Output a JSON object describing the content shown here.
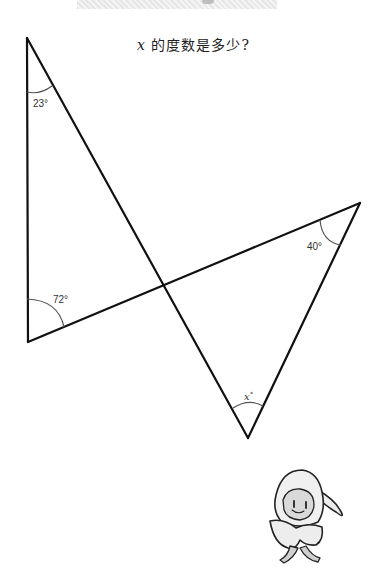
{
  "banner": {
    "icon": "banner-decoration"
  },
  "question": {
    "variable": "x",
    "text": "的度数是多少?"
  },
  "diagram": {
    "vertices": {
      "top_left": [
        27,
        38
      ],
      "bottom_left": [
        28,
        342
      ],
      "right": [
        360,
        203
      ],
      "bottom": [
        248,
        438
      ],
      "intersection": [
        163,
        286
      ]
    },
    "angles": [
      {
        "label": "23°",
        "at": "top_left"
      },
      {
        "label": "72°",
        "at": "bottom_left"
      },
      {
        "label": "40°",
        "at": "right"
      },
      {
        "label": "x°",
        "at": "bottom",
        "unknown": true
      }
    ],
    "line_color": "#111111",
    "arc_color": "#555555"
  },
  "mascot": {
    "icon": "hooded-character-mascot"
  },
  "labels": {
    "a23": "23°",
    "a72": "72°",
    "a40": "40°",
    "ax_var": "x",
    "ax_deg": "°"
  }
}
